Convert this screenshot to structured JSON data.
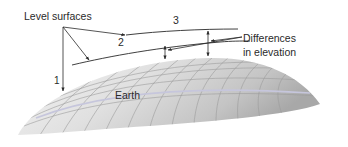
{
  "diagram": {
    "labels": {
      "level_surfaces": "Level surfaces",
      "surface_1": "1",
      "surface_2": "2",
      "surface_3": "3",
      "differences_line1": "Differences",
      "differences_line2": "in elevation",
      "earth": "Earth"
    },
    "colors": {
      "line": "#2a2a2a",
      "earth_light": "#f2f2f2",
      "earth_mid": "#d6d6d6",
      "earth_dark": "#a8a8a8",
      "grid": "#9a9a9a",
      "highlight_band": "#c8c8dc"
    }
  }
}
